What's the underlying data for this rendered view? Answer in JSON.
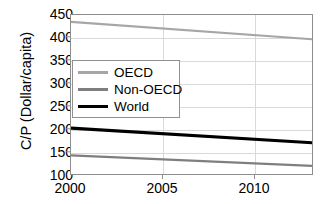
{
  "chart_data": {
    "type": "line",
    "title": "",
    "xlabel": "",
    "ylabel": "C/P (Dollar/capita)",
    "xlim": [
      2000,
      2013
    ],
    "ylim": [
      100,
      450
    ],
    "xticks": [
      2000,
      2005,
      2010
    ],
    "yticks": [
      100,
      150,
      200,
      250,
      300,
      350,
      400,
      450
    ],
    "grid": true,
    "legend_position": "upper-left-inside",
    "x": [
      2000,
      2013
    ],
    "series": [
      {
        "name": "OECD",
        "values": [
          435,
          397
        ],
        "color": "#a6a6a6",
        "width": 2.2
      },
      {
        "name": "Non-OECD",
        "values": [
          145,
          122
        ],
        "color": "#7f7f7f",
        "width": 2.2
      },
      {
        "name": "World",
        "values": [
          204,
          172
        ],
        "color": "#000000",
        "width": 3.2
      }
    ]
  },
  "axis": {
    "y_title": "C/P (Dollar/capita)",
    "y_tick_labels": [
      "450",
      "400",
      "350",
      "300",
      "250",
      "200",
      "150",
      "100"
    ],
    "x_tick_labels": [
      "2000",
      "2005",
      "2010"
    ]
  },
  "legend": {
    "items": [
      {
        "label": "OECD"
      },
      {
        "label": "Non-OECD"
      },
      {
        "label": "World"
      }
    ]
  },
  "colors": {
    "oecd": "#a6a6a6",
    "non_oecd": "#7f7f7f",
    "world": "#000000",
    "frame": "#8d8d8d",
    "grid": "#d9d9d9",
    "background": "#ffffff"
  }
}
